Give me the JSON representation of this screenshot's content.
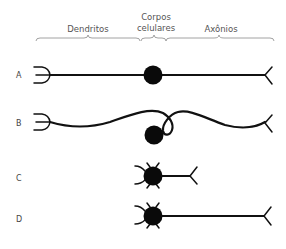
{
  "header": {
    "dendrites_label": "Dendritos",
    "cell_body_label_line1": "Corpos",
    "cell_body_label_line2": "celulares",
    "axon_label": "Axônios"
  },
  "rows": [
    {
      "label": "A",
      "type": "bipolar-straight"
    },
    {
      "label": "B",
      "type": "pseudounipolar-wavy"
    },
    {
      "label": "C",
      "type": "multipolar-short-axon"
    },
    {
      "label": "D",
      "type": "multipolar-long-axon"
    }
  ],
  "colors": {
    "ink": "#111111",
    "brace": "#8a8a8a",
    "label_text": "#555555"
  }
}
